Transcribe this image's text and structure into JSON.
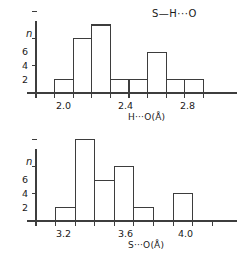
{
  "figure": {
    "kind": "two-panel-histogram",
    "ink_color": "#3d3d3d",
    "background": "#ffffff"
  },
  "chart_data": [
    {
      "type": "bar",
      "panel": "top",
      "title": "S—H···O",
      "xlabel": "H···O(Å)",
      "ylabel": "n",
      "bin_width": 0.1,
      "bin_starts": [
        2.0,
        2.1,
        2.2,
        2.3,
        2.4,
        2.5,
        2.6,
        2.7
      ],
      "categories": [
        "2.0-2.1",
        "2.1-2.2",
        "2.2-2.3",
        "2.3-2.4",
        "2.4-2.5",
        "2.5-2.6",
        "2.6-2.7",
        "2.7-2.8"
      ],
      "values": [
        1,
        4,
        5,
        1,
        1,
        3,
        1,
        1
      ],
      "xlim": [
        1.9,
        2.9
      ],
      "ylim": [
        0,
        7
      ],
      "xticks": [
        1.9,
        2.0,
        2.1,
        2.2,
        2.3,
        2.4,
        2.5,
        2.6,
        2.7,
        2.8
      ],
      "xticklabels": [
        {
          "value": 2.0,
          "text": "2.0"
        },
        {
          "value": 2.4,
          "text": "2.4"
        },
        {
          "value": 2.8,
          "text": "2.8"
        }
      ],
      "yticks": [
        2,
        4,
        6
      ],
      "yticklabels": [
        "2",
        "4",
        "6"
      ],
      "grid": false,
      "legend": null
    },
    {
      "type": "bar",
      "panel": "bottom",
      "title": "",
      "xlabel": "S···O(Å)",
      "ylabel": "n",
      "bin_width": 0.1,
      "bin_starts": [
        3.2,
        3.3,
        3.4,
        3.5,
        3.6,
        3.7,
        3.8
      ],
      "categories": [
        "3.2-3.3",
        "3.3-3.4",
        "3.4-3.5",
        "3.5-3.6",
        "3.6-3.7",
        "3.7-3.8",
        "3.8-3.9"
      ],
      "values": [
        1,
        6,
        3,
        4,
        1,
        0,
        2
      ],
      "xlim": [
        3.1,
        4.05
      ],
      "ylim": [
        0,
        7
      ],
      "xticks": [
        3.1,
        3.2,
        3.3,
        3.4,
        3.5,
        3.6,
        3.7,
        3.8,
        3.9,
        4.0
      ],
      "xticklabels": [
        {
          "value": 3.2,
          "text": "3.2"
        },
        {
          "value": 3.6,
          "text": "3.6"
        },
        {
          "value": 4.0,
          "text": "4.0"
        }
      ],
      "yticks": [
        2,
        4,
        6
      ],
      "yticklabels": [
        "2",
        "4",
        "6"
      ],
      "grid": false,
      "legend": null
    }
  ],
  "top": {
    "annotation": "S—H···O",
    "ylabel": "n",
    "xlabel": "H···O(Å)",
    "ytick_2": "2",
    "ytick_4": "4",
    "ytick_6": "6",
    "xtick_a": "2.0",
    "xtick_b": "2.4",
    "xtick_c": "2.8"
  },
  "bottom": {
    "ylabel": "n",
    "xlabel": "S···O(Å)",
    "ytick_2": "2",
    "ytick_4": "4",
    "ytick_6": "6",
    "xtick_a": "3.2",
    "xtick_b": "3.6",
    "xtick_c": "4.0"
  }
}
